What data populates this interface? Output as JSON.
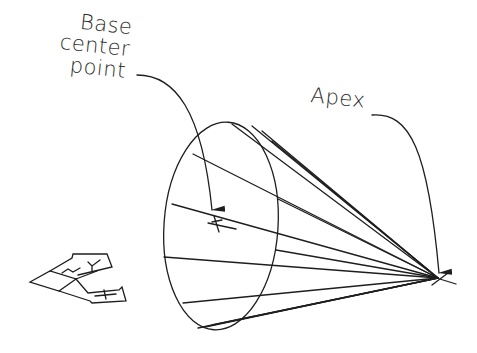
{
  "labels": {
    "base_center_line1": "Base",
    "base_center_line2": "center",
    "base_center_line3": "point",
    "apex": "Apex"
  },
  "colors": {
    "line": "#1e1e1e",
    "background": "#ffffff"
  },
  "geometry": {
    "apex": [
      438,
      278
    ],
    "base_center": [
      213,
      222
    ],
    "base_ellipse": {
      "cx": 221,
      "cy": 226,
      "rx": 58,
      "ry": 104
    },
    "ucs_icon": "isometric-ucs-icon"
  }
}
